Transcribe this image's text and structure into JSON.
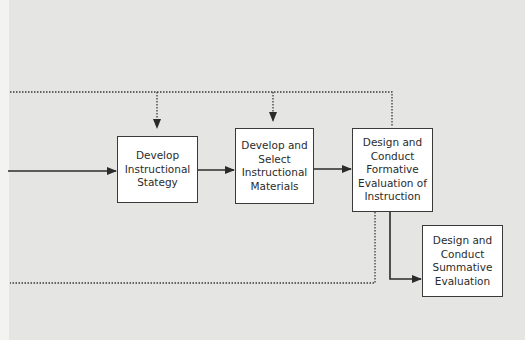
{
  "diagram": {
    "type": "flowchart",
    "colors": {
      "background": "#e5e5e3",
      "box_fill": "#ffffff",
      "stroke": "#2b2b2b"
    },
    "boxes": [
      {
        "id": "develop-strategy",
        "lines": [
          "Develop",
          "Instructional",
          "Stategy"
        ]
      },
      {
        "id": "develop-materials",
        "lines": [
          "Develop and",
          "Select",
          "Instructional",
          "Materials"
        ]
      },
      {
        "id": "formative-evaluation",
        "lines": [
          "Design and",
          "Conduct",
          "Formative",
          "Evaluation of",
          "Instruction"
        ]
      },
      {
        "id": "summative-evaluation",
        "lines": [
          "Design and",
          "Conduct",
          "Summative",
          "Evaluation"
        ]
      }
    ],
    "connectors": [
      {
        "from": "left-offscreen",
        "to": "develop-strategy",
        "style": "solid"
      },
      {
        "from": "develop-strategy",
        "to": "develop-materials",
        "style": "solid"
      },
      {
        "from": "develop-materials",
        "to": "formative-evaluation",
        "style": "solid"
      },
      {
        "from": "formative-evaluation",
        "to": "summative-evaluation",
        "style": "solid"
      },
      {
        "from": "formative-evaluation",
        "to": "feedback-top",
        "style": "dotted"
      },
      {
        "from": "feedback-top",
        "to": "develop-strategy",
        "style": "dotted"
      },
      {
        "from": "feedback-top",
        "to": "develop-materials",
        "style": "dotted"
      },
      {
        "from": "formative-evaluation",
        "to": "left-offscreen-bottom",
        "style": "dotted"
      }
    ]
  }
}
